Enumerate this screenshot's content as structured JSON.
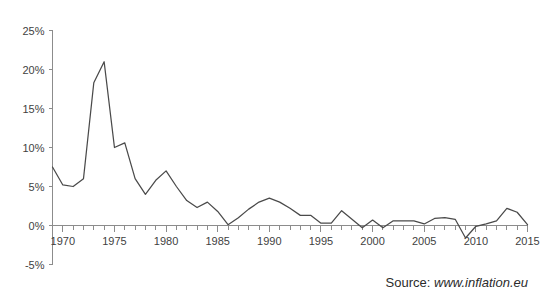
{
  "figure": {
    "title_remnant": "",
    "background_color": "#ffffff"
  },
  "source": {
    "prefix": "Source:",
    "url": "www.inflation.eu"
  },
  "chart_data": {
    "type": "line",
    "title": "",
    "subtitle": "",
    "xlabel": "",
    "ylabel": "",
    "xlim": [
      1969,
      2015
    ],
    "ylim": [
      -5,
      25
    ],
    "ytick_values": [
      -5,
      0,
      5,
      10,
      15,
      20,
      25
    ],
    "ytick_labels": [
      "-5%",
      "0%",
      "5%",
      "10%",
      "15%",
      "20%",
      "25%"
    ],
    "xtick_labels": [
      "1970",
      "1975",
      "1980",
      "1985",
      "1990",
      "1995",
      "2000",
      "2005",
      "2010",
      "2015"
    ],
    "xtick_values": [
      1970,
      1975,
      1980,
      1985,
      1990,
      1995,
      2000,
      2005,
      2010,
      2015
    ],
    "minor_xtick_interval": 1,
    "grid": false,
    "legend": false,
    "legend_position": "none",
    "line_color": "#4a4a4a",
    "axis_color": "#8c8c8c",
    "series": [
      {
        "name": "Inflation rate",
        "x": [
          1969,
          1970,
          1971,
          1972,
          1973,
          1974,
          1975,
          1976,
          1977,
          1978,
          1979,
          1980,
          1981,
          1982,
          1983,
          1984,
          1985,
          1986,
          1987,
          1988,
          1989,
          1990,
          1991,
          1992,
          1993,
          1994,
          1995,
          1996,
          1997,
          1998,
          1999,
          2000,
          2001,
          2002,
          2003,
          2004,
          2005,
          2006,
          2007,
          2008,
          2009,
          2010,
          2011,
          2012,
          2013,
          2014,
          2015
        ],
        "values": [
          7.5,
          5.2,
          5.0,
          6.0,
          18.3,
          21.0,
          10.0,
          10.6,
          6.0,
          4.0,
          5.8,
          7.0,
          5.0,
          3.2,
          2.3,
          3.0,
          1.8,
          0.1,
          1.0,
          2.1,
          3.0,
          3.5,
          3.0,
          2.2,
          1.3,
          1.3,
          0.3,
          0.3,
          1.9,
          0.8,
          -0.3,
          0.7,
          -0.3,
          0.6,
          0.6,
          0.6,
          0.2,
          0.9,
          1.0,
          0.8,
          -1.6,
          -0.1,
          0.2,
          0.6,
          2.2,
          1.7,
          0.1
        ]
      }
    ]
  }
}
